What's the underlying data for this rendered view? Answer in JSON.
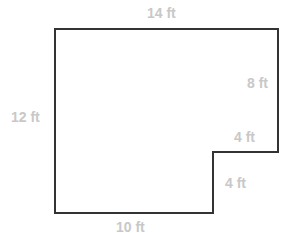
{
  "diagram": {
    "type": "floor-plan",
    "shape": "L-shaped polygon",
    "stroke_color": "#333333",
    "label_color": "#c8c8c8",
    "vertices": [
      [
        55,
        29
      ],
      [
        278,
        29
      ],
      [
        278,
        152
      ],
      [
        213,
        152
      ],
      [
        213,
        213
      ],
      [
        55,
        213
      ]
    ],
    "labels": {
      "top": "14 ft",
      "right_upper": "8 ft",
      "step_horizontal": "4 ft",
      "step_vertical": "4 ft",
      "bottom": "10 ft",
      "left": "12 ft"
    }
  }
}
